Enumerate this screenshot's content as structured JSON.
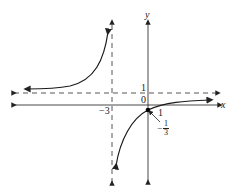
{
  "graph": {
    "type": "rational function graph",
    "axes": {
      "x_label": "x",
      "y_label": "y"
    },
    "asymptotes": {
      "vertical": {
        "value": -3,
        "label": "−3",
        "style": "dashed"
      },
      "horizontal": {
        "value": 1,
        "label": "1",
        "style": "dashed"
      }
    },
    "tick_labels": {
      "origin": "0",
      "x_one": "1"
    },
    "point": {
      "label_sign": "−",
      "label_num": "1",
      "label_den": "3",
      "description": "y-intercept at (0, −1/3)"
    },
    "colors": {
      "curve": "#1a1a1a",
      "axis": "#333333",
      "dashed": "#444444"
    }
  }
}
